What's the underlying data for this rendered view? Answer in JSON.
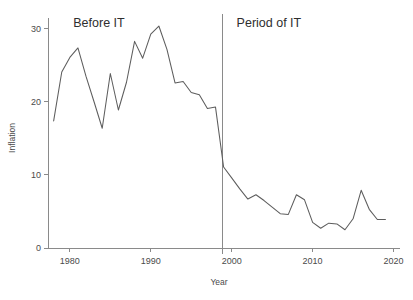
{
  "chart_data": {
    "type": "line",
    "title": "",
    "xlabel": "Year",
    "ylabel": "Inflation",
    "xlim": [
      1977.3,
      2020.8
    ],
    "ylim": [
      0,
      31.5
    ],
    "xticks": [
      1980,
      1990,
      2000,
      2010,
      2020
    ],
    "xticklabels": [
      "1980",
      "1990",
      "2000",
      "2010",
      "2020"
    ],
    "yticks": [
      0,
      10,
      20,
      30
    ],
    "yticklabels": [
      "0",
      "10",
      "20",
      "30"
    ],
    "grid": false,
    "legend": "none",
    "line_color": "#5d5d5d",
    "axis_color": "#8a8a8a",
    "background": "#ffffff",
    "series": [
      {
        "name": "Inflation",
        "x": [
          1978,
          1979,
          1980,
          1981,
          1982,
          1983,
          1984,
          1985,
          1986,
          1987,
          1988,
          1989,
          1990,
          1991,
          1992,
          1993,
          1994,
          1995,
          1996,
          1997,
          1998,
          1999,
          2000,
          2001,
          2002,
          2003,
          2004,
          2005,
          2006,
          2007,
          2008,
          2009,
          2010,
          2011,
          2012,
          2013,
          2014,
          2015,
          2016,
          2017,
          2018,
          2019
        ],
        "y": [
          17.4,
          24.1,
          26.1,
          27.4,
          23.5,
          20.0,
          16.4,
          23.9,
          18.9,
          22.7,
          28.3,
          26.0,
          29.3,
          30.4,
          27.2,
          22.6,
          22.8,
          21.3,
          21.0,
          19.1,
          19.3,
          11.1,
          9.6,
          8.1,
          6.7,
          7.3,
          6.5,
          5.6,
          4.7,
          4.6,
          7.3,
          6.6,
          3.5,
          2.7,
          3.4,
          3.3,
          2.5,
          4.0,
          7.9,
          5.3,
          3.9,
          3.9
        ]
      }
    ],
    "annotations": [
      {
        "id": "before-it",
        "text": "Before IT",
        "x": 1983.6,
        "y": 30.2
      },
      {
        "id": "period-of-it",
        "text": "Period of IT",
        "x": 2004.6,
        "y": 30.2
      }
    ],
    "reference_lines": [
      {
        "id": "it-start-divider",
        "orientation": "vertical",
        "x": 1998.9
      }
    ]
  }
}
